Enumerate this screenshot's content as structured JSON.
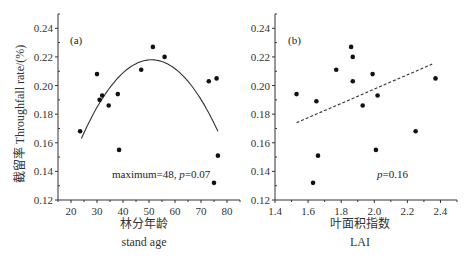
{
  "chart_data": [
    {
      "type": "scatter",
      "panel_label": "(a)",
      "title": "",
      "xlabel": "林分年龄",
      "xlabel_en": "stand age",
      "ylabel": "截留率 Throughfall rate/(%)",
      "xlim": [
        15,
        85
      ],
      "ylim": [
        0.12,
        0.25
      ],
      "xticks": [
        20,
        30,
        40,
        50,
        60,
        70,
        80
      ],
      "yticks": [
        0.12,
        0.14,
        0.16,
        0.18,
        0.2,
        0.22,
        0.24
      ],
      "ytick_labels": [
        "0.12",
        "0.14",
        "0.16",
        "0.18",
        "0.20",
        "0.22",
        "0.24"
      ],
      "grid": false,
      "annotation": "maximum=48, p=0.07",
      "annotation_prefix": "maximum=48, ",
      "annotation_p": "p",
      "annotation_value": "=0.07",
      "fit": {
        "type": "quadratic",
        "style": "solid",
        "x_range": [
          24,
          76.5
        ],
        "vertex": [
          51,
          0.218
        ],
        "end_y": [
          0.163,
          0.168
        ]
      },
      "points": [
        {
          "x": 23.5,
          "y": 0.168
        },
        {
          "x": 30,
          "y": 0.208
        },
        {
          "x": 31,
          "y": 0.19
        },
        {
          "x": 32,
          "y": 0.193
        },
        {
          "x": 34.5,
          "y": 0.186
        },
        {
          "x": 38,
          "y": 0.194
        },
        {
          "x": 38.5,
          "y": 0.155
        },
        {
          "x": 47,
          "y": 0.211
        },
        {
          "x": 51.5,
          "y": 0.227
        },
        {
          "x": 56,
          "y": 0.22
        },
        {
          "x": 73,
          "y": 0.203
        },
        {
          "x": 76,
          "y": 0.205
        },
        {
          "x": 75,
          "y": 0.132
        },
        {
          "x": 76.5,
          "y": 0.151
        }
      ]
    },
    {
      "type": "scatter",
      "panel_label": "(b)",
      "title": "",
      "xlabel": "叶面积指数",
      "xlabel_en": "LAI",
      "ylabel": "",
      "xlim": [
        1.4,
        2.5
      ],
      "ylim": [
        0.12,
        0.25
      ],
      "xticks": [
        1.4,
        1.6,
        1.8,
        2.0,
        2.2,
        2.4
      ],
      "xtick_labels": [
        "1.4",
        "1.6",
        "1.8",
        "2.0",
        "2.2",
        "2.4"
      ],
      "yticks": [
        0.12,
        0.14,
        0.16,
        0.18,
        0.2,
        0.22,
        0.24
      ],
      "ytick_labels": [
        "0.12",
        "0.14",
        "0.16",
        "0.18",
        "0.20",
        "0.22",
        "0.24"
      ],
      "grid": false,
      "annotation": "p=0.16",
      "annotation_p": "p",
      "annotation_value": "=0.16",
      "fit": {
        "type": "linear",
        "style": "dashed",
        "from": [
          1.53,
          0.174
        ],
        "to": [
          2.35,
          0.215
        ]
      },
      "points": [
        {
          "x": 1.53,
          "y": 0.194
        },
        {
          "x": 1.65,
          "y": 0.189
        },
        {
          "x": 1.63,
          "y": 0.132
        },
        {
          "x": 1.66,
          "y": 0.151
        },
        {
          "x": 1.77,
          "y": 0.211
        },
        {
          "x": 1.86,
          "y": 0.227
        },
        {
          "x": 1.87,
          "y": 0.22
        },
        {
          "x": 1.87,
          "y": 0.203
        },
        {
          "x": 1.93,
          "y": 0.186
        },
        {
          "x": 1.99,
          "y": 0.208
        },
        {
          "x": 2.01,
          "y": 0.155
        },
        {
          "x": 2.02,
          "y": 0.193
        },
        {
          "x": 2.25,
          "y": 0.168
        },
        {
          "x": 2.37,
          "y": 0.205
        }
      ]
    }
  ],
  "colors": {
    "axis": "#333333",
    "points": "#111111",
    "fit": "#333333"
  }
}
